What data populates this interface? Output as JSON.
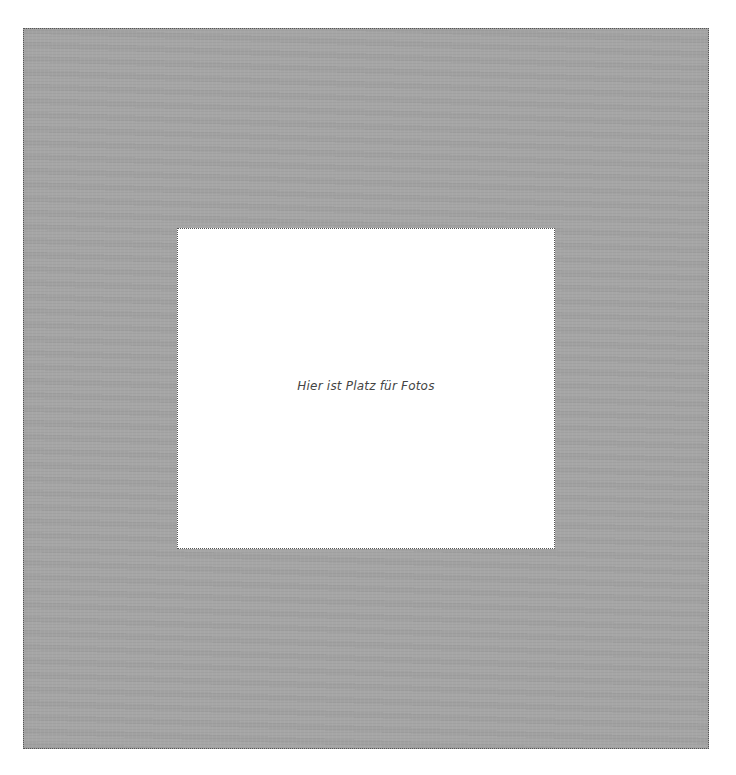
{
  "page": {
    "mat_color": "#a6a6a6",
    "photo_slot": {
      "placeholder_text": "Hier ist Platz für Fotos"
    }
  }
}
